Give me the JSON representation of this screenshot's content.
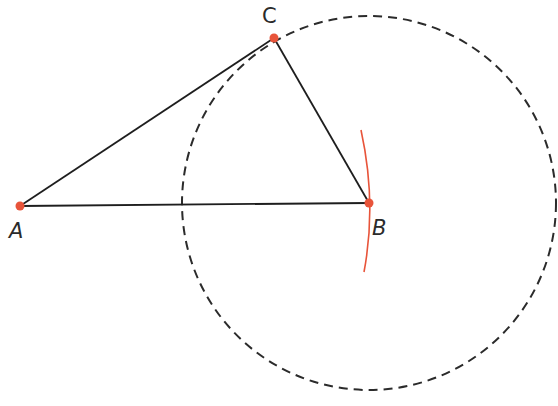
{
  "diagram": {
    "points": [
      {
        "id": "A",
        "label": "A"
      },
      {
        "id": "B",
        "label": "B"
      },
      {
        "id": "C",
        "label": "C"
      }
    ],
    "segments": [
      {
        "from": "A",
        "to": "B"
      },
      {
        "from": "B",
        "to": "C"
      },
      {
        "from": "C",
        "to": "A"
      }
    ],
    "circle": {
      "center": "B",
      "through": "C",
      "style": "dashed"
    },
    "arc": {
      "near": "B",
      "style": "solid"
    },
    "colors": {
      "line": "#1e1e1e",
      "point": "#e8543a",
      "arc": "#e8543a",
      "circle": "#2b2b2b",
      "label": "#2b2b2b"
    }
  }
}
